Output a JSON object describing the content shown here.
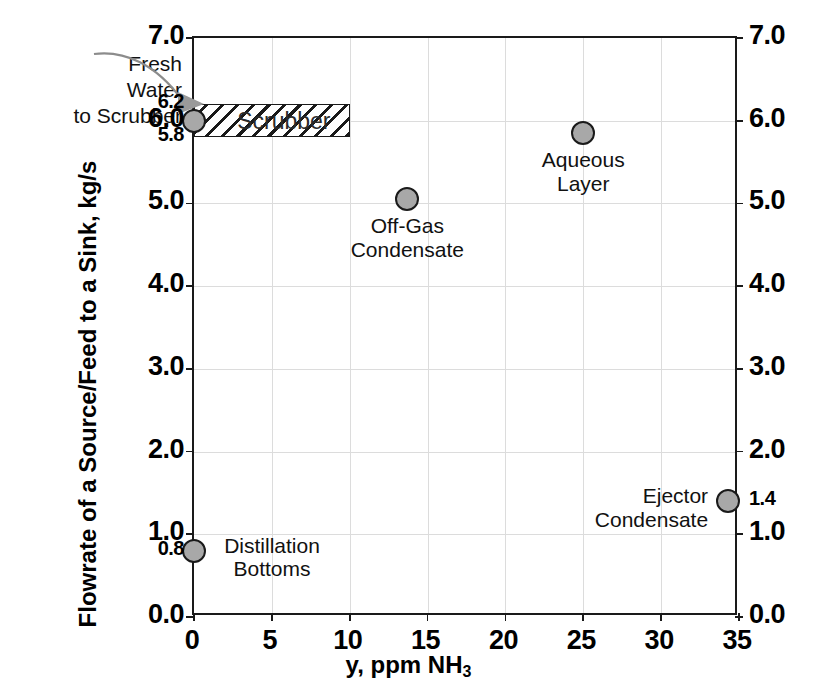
{
  "chart_data": {
    "type": "scatter",
    "title": "",
    "xlabel": "y, ppm NH3",
    "xlabel_main": "y, ppm NH",
    "xlabel_sub": "3",
    "ylabel": "Flowrate of a Source/Feed to a Sink, kg/s",
    "xlim": [
      0,
      35
    ],
    "ylim": [
      0,
      7
    ],
    "grid": true,
    "legend": "none",
    "x_ticks": [
      0,
      5,
      10,
      15,
      20,
      25,
      30,
      35
    ],
    "x_tick_labels": [
      "0",
      "5",
      "10",
      "15",
      "20",
      "25",
      "30",
      "35"
    ],
    "y_ticks_major": [
      0.0,
      1.0,
      2.0,
      3.0,
      4.0,
      5.0,
      6.0,
      7.0
    ],
    "y_tick_labels_left_major": [
      "0.0",
      "1.0",
      "2.0",
      "3.0",
      "4.0",
      "5.0",
      "6.0",
      "7.0"
    ],
    "y_extra_ticks_left": [
      0.8,
      5.8,
      6.2
    ],
    "y_extra_labels_left": [
      "0.8",
      "5.8",
      "6.2"
    ],
    "y_tick_labels_right_major": [
      "0.0",
      "1.0",
      "2.0",
      "3.0",
      "4.0",
      "5.0",
      "6.0",
      "7.0"
    ],
    "y_extra_ticks_right": [
      1.4
    ],
    "y_extra_labels_right": [
      "1.4"
    ],
    "points": [
      {
        "name": "fresh-water-to-scrubber",
        "label": "",
        "x": 0,
        "y": 6.0
      },
      {
        "name": "distillation-bottoms",
        "label": "Distillation\nBottoms",
        "label_line1": "Distillation",
        "label_line2": "Bottoms",
        "x": 0,
        "y": 0.8
      },
      {
        "name": "off-gas-condensate",
        "label": "Off-Gas\nCondensate",
        "label_line1": "Off-Gas",
        "label_line2": "Condensate",
        "x": 13.7,
        "y": 5.05
      },
      {
        "name": "aqueous-layer",
        "label": "Aqueous\nLayer",
        "label_line1": "Aqueous",
        "label_line2": "Layer",
        "x": 25.0,
        "y": 5.85
      },
      {
        "name": "ejector-condensate",
        "label": "Ejector\nCondensate",
        "label_line1": "Ejector",
        "label_line2": "Condensate",
        "x": 34.3,
        "y": 1.4
      }
    ],
    "regions": [
      {
        "name": "scrubber",
        "label": "Scrubber",
        "x0": 0,
        "x1": 10,
        "y0": 5.8,
        "y1": 6.2,
        "hatched": true
      }
    ],
    "annotations": [
      {
        "name": "fresh-water-to-scrubber-annotation",
        "line1": "Fresh",
        "line2": "Water",
        "line3": "to Scrubber",
        "target_x": 0,
        "target_y": 6.0
      }
    ],
    "colors": {
      "marker_fill": "#a8a8a8",
      "marker_edge": "#1a1a1a",
      "axis": "#1a1a1a",
      "grid": "#dcdcdc",
      "annotation_arrow": "#8c8c8c",
      "region_label": "#2b2b2b"
    }
  }
}
